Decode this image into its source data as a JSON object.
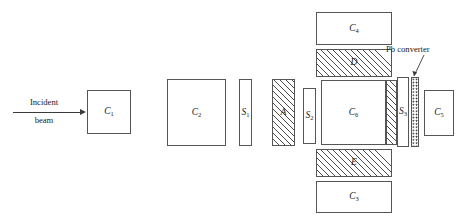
{
  "diagram": {
    "beam": {
      "label_line1": "Incident",
      "label_line2": "beam",
      "arrow_icon": "right-arrow-icon"
    },
    "annotation": {
      "pb_converter_label": "Pb converter",
      "leader_icon": "leader-line-icon"
    },
    "counters": {
      "c1": {
        "base": "C",
        "sub": "1"
      },
      "c2": {
        "base": "C",
        "sub": "2"
      },
      "c3": {
        "base": "C",
        "sub": "3"
      },
      "c4": {
        "base": "C",
        "sub": "4"
      },
      "c5": {
        "base": "C",
        "sub": "5"
      },
      "c6": {
        "base": "C",
        "sub": "6"
      }
    },
    "scintillators": {
      "s1": {
        "base": "S",
        "sub": "1"
      },
      "s2": {
        "base": "S",
        "sub": "2"
      },
      "s3": {
        "base": "S",
        "sub": "3"
      }
    },
    "absorbers": {
      "a": "A",
      "d": "D",
      "e": "E"
    },
    "colors": {
      "outline": "#555555",
      "hatch": "#4a4a4a",
      "stipple": "#3a3a3a",
      "text": "#1a1a1a",
      "background": "#ffffff"
    }
  }
}
